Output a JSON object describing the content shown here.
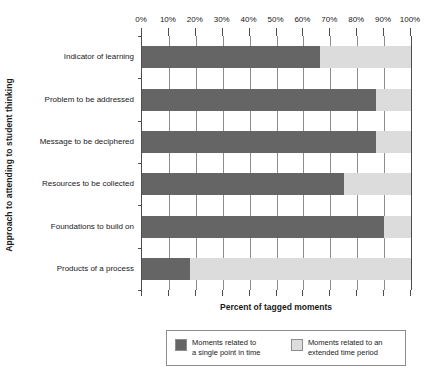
{
  "chart_data": {
    "type": "bar",
    "orientation": "horizontal",
    "stacked": true,
    "title": "",
    "xlabel": "Percent of tagged moments",
    "ylabel": "Approach to attending to student thinking",
    "xlim": [
      0,
      100
    ],
    "xticks": [
      0,
      10,
      20,
      30,
      40,
      50,
      60,
      70,
      80,
      90,
      100
    ],
    "xticklabels": [
      "0%",
      "10%",
      "20%",
      "30%",
      "40%",
      "50%",
      "60%",
      "70%",
      "80%",
      "90%",
      "100%"
    ],
    "grid": true,
    "grid_axis": "x",
    "legend_position": "bottom",
    "categories": [
      "Indicator of learning",
      "Problem to be addressed",
      "Message to be deciphered",
      "Resources to be collected",
      "Foundations to build on",
      "Products of a process"
    ],
    "series": [
      {
        "name": "Moments related to a single point in time",
        "color": "#656565",
        "values": [
          66,
          87,
          87,
          75,
          90,
          18
        ]
      },
      {
        "name": "Moments related to an extended time period",
        "color": "#dcdcdc",
        "values": [
          34,
          13,
          13,
          25,
          10,
          82
        ]
      }
    ]
  },
  "axes": {
    "y_title": "Approach to attending to student thinking",
    "x_title": "Percent of tagged moments",
    "tick_labels": [
      "0%",
      "10%",
      "20%",
      "30%",
      "40%",
      "50%",
      "60%",
      "70%",
      "80%",
      "90%",
      "100%"
    ],
    "category_labels": [
      "Indicator of learning",
      "Problem to be addressed",
      "Message to be deciphered",
      "Resources to be collected",
      "Foundations to build on",
      "Products of a process"
    ]
  },
  "legend": {
    "entries": [
      {
        "label": "Moments related to\na single point in time",
        "swatch": "dark",
        "color": "#656565"
      },
      {
        "label": "Moments related to an\nextended time period",
        "swatch": "light",
        "color": "#dcdcdc"
      }
    ]
  }
}
